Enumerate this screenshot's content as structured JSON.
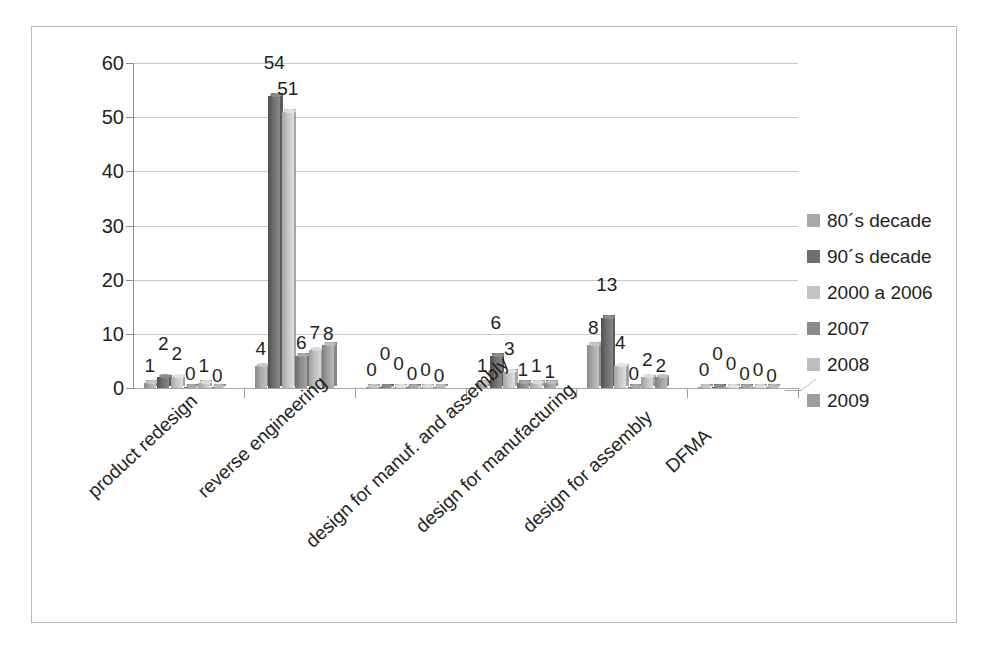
{
  "chart_data": {
    "type": "bar",
    "title": "",
    "subtitle": "",
    "xlabel": "",
    "ylabel": "",
    "ylim": [
      0,
      60
    ],
    "yticks": [
      0,
      10,
      20,
      30,
      40,
      50,
      60
    ],
    "grid": true,
    "legend_position": "right",
    "three_d": true,
    "categories": [
      "product redesign",
      "reverse engineering",
      "design for manuf. and assembly",
      "design for manufacturing",
      "design for assembly",
      "DFMA"
    ],
    "series": [
      {
        "name": "80´s decade",
        "color": "#a8a8a8",
        "values": [
          1,
          4,
          0,
          1,
          8,
          0
        ]
      },
      {
        "name": "90´s decade",
        "color": "#6e6e6e",
        "values": [
          2,
          54,
          0,
          6,
          13,
          0
        ]
      },
      {
        "name": "2000 a 2006",
        "color": "#c4c4c4",
        "values": [
          2,
          51,
          0,
          3,
          4,
          0
        ]
      },
      {
        "name": "2007",
        "color": "#8a8a8a",
        "values": [
          0,
          6,
          0,
          1,
          0,
          0
        ]
      },
      {
        "name": "2008",
        "color": "#bdbdbd",
        "values": [
          1,
          7,
          0,
          1,
          2,
          0
        ]
      },
      {
        "name": "2009",
        "color": "#9e9e9e",
        "values": [
          0,
          8,
          0,
          1,
          2,
          0
        ]
      }
    ],
    "data_labels": [
      [
        "1",
        "2",
        "2",
        "0",
        "1",
        "0"
      ],
      [
        "4",
        "54",
        "51",
        "6",
        "7",
        "8"
      ],
      [
        "0",
        "0",
        "0",
        "0",
        "0",
        "0"
      ],
      [
        "1",
        "6",
        "3",
        "1",
        "1",
        "1"
      ],
      [
        "8",
        "13",
        "4",
        "0",
        "2",
        "2"
      ],
      [
        "0",
        "0",
        "0",
        "0",
        "0",
        "0"
      ]
    ]
  },
  "axis": {
    "y_tick_labels": [
      "60",
      "50",
      "40",
      "30",
      "20",
      "10",
      "0"
    ]
  },
  "legend": {
    "items": [
      {
        "label": "80´s decade",
        "color": "#a8a8a8"
      },
      {
        "label": "90´s decade",
        "color": "#6e6e6e"
      },
      {
        "label": "2000 a 2006",
        "color": "#c4c4c4"
      },
      {
        "label": "2007",
        "color": "#8a8a8a"
      },
      {
        "label": "2008",
        "color": "#bdbdbd"
      },
      {
        "label": "2009",
        "color": "#9e9e9e"
      }
    ]
  },
  "colors": {
    "frame_border": "#b9b9bb",
    "gridline": "#c9c9cb",
    "axis_line": "#8f8f91",
    "text": "#231f20",
    "background": "#ffffff"
  }
}
